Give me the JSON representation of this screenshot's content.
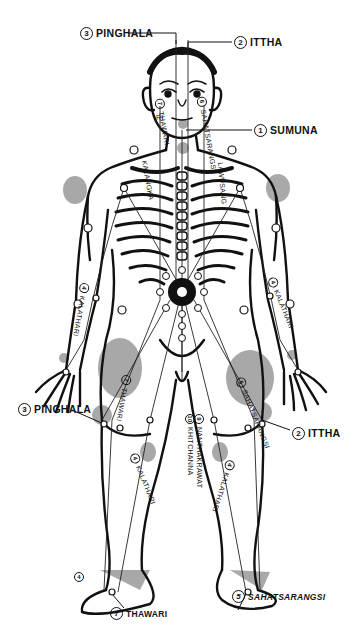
{
  "diagram": {
    "type": "anatomical-energy-line-chart",
    "colors": {
      "ink": "#111111",
      "shading": "#9a9a9a",
      "background": "#ffffff"
    }
  },
  "labels": {
    "pinghala_top": {
      "num": "3",
      "text": "PINGHALA"
    },
    "ittha_top": {
      "num": "2",
      "text": "ITTHA"
    },
    "sumuna": {
      "num": "1",
      "text": "SUMUNA"
    },
    "face_left": {
      "num": "7",
      "text": "THAWARI"
    },
    "face_left2": {
      "text": "RI"
    },
    "face_right": {
      "num": "6",
      "text": "SAHATSARANGSI"
    },
    "chest_left": {
      "text": "KALANGKA"
    },
    "chest_right": {
      "text": "LAWUSANG"
    },
    "arm_left": {
      "num": "4",
      "text": "KALATHARI"
    },
    "arm_right": {
      "num": "4",
      "text": "KALATHARI"
    },
    "pinghala_side": {
      "num": "3",
      "text": "PINGHALA"
    },
    "ittha_side": {
      "num": "2",
      "text": "ITTHA"
    },
    "thigh_left": {
      "num": "7",
      "text": "THAWARI"
    },
    "thigh_right": {
      "num": "6",
      "text": "SAHATSARANGSI"
    },
    "center_1": {
      "num": "9",
      "text": "NANTHAKRAWAT"
    },
    "center_2": {
      "num": "10",
      "text": "KHITCHANNA"
    },
    "leg_left": {
      "num": "4",
      "text": "KALATHARI"
    },
    "leg_right": {
      "num": "4",
      "text": "KALATHARI"
    },
    "foot_left": {
      "num": "7",
      "text": "THAWARI"
    },
    "foot_right": {
      "num": "5",
      "text": "SAHATSARANGSI"
    },
    "foot_left_num": {
      "num": "4"
    }
  },
  "markers": {
    "navel_center": "sun-wheel",
    "numbered_points": [
      "1",
      "2",
      "3",
      "4",
      "5",
      "6",
      "7",
      "8",
      "9",
      "10"
    ]
  }
}
